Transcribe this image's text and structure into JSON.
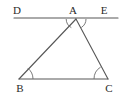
{
  "figure": {
    "background_color": "#ffffff",
    "stroke_color": "#575757",
    "arc_color": "#6b6b6b",
    "label_color": "#2b2b2b",
    "points": {
      "D": {
        "label": "D",
        "x": 16,
        "y": 18,
        "label_x": 17,
        "label_y": 14
      },
      "E": {
        "label": "E",
        "x": 118,
        "y": 18,
        "label_x": 104,
        "label_y": 14
      },
      "A": {
        "label": "A",
        "x": 76,
        "y": 19,
        "label_x": 73,
        "label_y": 14
      },
      "B": {
        "label": "B",
        "x": 19,
        "y": 79,
        "label_x": 20,
        "label_y": 92
      },
      "C": {
        "label": "C",
        "x": 108,
        "y": 79,
        "label_x": 109,
        "label_y": 92
      }
    },
    "segments": [
      {
        "name": "line-DE",
        "from": "D",
        "to": "E",
        "path": "M 14 18 L 118 18"
      },
      {
        "name": "side-AB",
        "from": "A",
        "to": "B",
        "path": "M 76 19 L 19 79"
      },
      {
        "name": "side-AC",
        "from": "A",
        "to": "C",
        "path": "M 76 19 L 108 79"
      },
      {
        "name": "side-BC",
        "from": "B",
        "to": "C",
        "path": "M 19 79 L 108 79"
      }
    ],
    "angle_marks": [
      {
        "name": "angle-DAB",
        "vertex": "A",
        "path": "M 66.2 19 A 10 10 0 0 0 71.3 27.6"
      },
      {
        "name": "angle-CAE",
        "vertex": "A",
        "path": "M 81.3 27.5 A 10 10 0 0 0 86 19"
      },
      {
        "name": "angle-ABC",
        "vertex": "B",
        "path": "M 33 79 A 14 14 0 0 0 27.8 68.2"
      },
      {
        "name": "angle-ACB",
        "vertex": "C",
        "path": "M 94 79 A 14 14 0 0 1 100.6 67.1"
      }
    ],
    "labels": [
      "D",
      "A",
      "E",
      "B",
      "C"
    ]
  }
}
